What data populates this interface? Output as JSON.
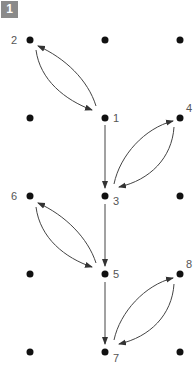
{
  "badge": "1",
  "grid": {
    "cols_x": [
      30,
      105,
      180
    ],
    "rows_y": [
      40,
      118,
      196,
      274,
      352
    ]
  },
  "nodes": [
    {
      "id": "1",
      "col": 1,
      "row": 1,
      "label": "1"
    },
    {
      "id": "2",
      "col": 0,
      "row": 0,
      "label": "2"
    },
    {
      "id": "3",
      "col": 1,
      "row": 2,
      "label": "3"
    },
    {
      "id": "4",
      "col": 2,
      "row": 1,
      "label": "4"
    },
    {
      "id": "5",
      "col": 1,
      "row": 3,
      "label": "5"
    },
    {
      "id": "6",
      "col": 0,
      "row": 2,
      "label": "6"
    },
    {
      "id": "7",
      "col": 1,
      "row": 4,
      "label": "7"
    },
    {
      "id": "8",
      "col": 2,
      "row": 3,
      "label": "8"
    }
  ],
  "edges": [
    {
      "from": "1",
      "to": "2",
      "type": "curved"
    },
    {
      "from": "2",
      "to": "1",
      "type": "curved"
    },
    {
      "from": "1",
      "to": "3",
      "type": "straight"
    },
    {
      "from": "3",
      "to": "4",
      "type": "curved"
    },
    {
      "from": "4",
      "to": "3",
      "type": "curved"
    },
    {
      "from": "3",
      "to": "5",
      "type": "straight"
    },
    {
      "from": "5",
      "to": "6",
      "type": "curved"
    },
    {
      "from": "6",
      "to": "5",
      "type": "curved"
    },
    {
      "from": "5",
      "to": "7",
      "type": "straight"
    },
    {
      "from": "7",
      "to": "8",
      "type": "curved"
    },
    {
      "from": "8",
      "to": "7",
      "type": "curved"
    }
  ],
  "labels": {
    "n1": "1",
    "n2": "2",
    "n3": "3",
    "n4": "4",
    "n5": "5",
    "n6": "6",
    "n7": "7",
    "n8": "8"
  }
}
